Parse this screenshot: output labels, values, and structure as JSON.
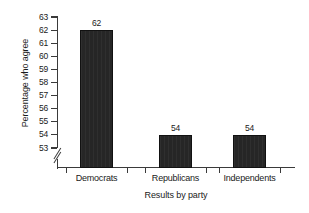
{
  "chart_data": {
    "type": "bar",
    "title": "",
    "xlabel": "Results by party",
    "ylabel": "Percentage who agree",
    "categories": [
      "Democrats",
      "Republicans",
      "Independents"
    ],
    "values": [
      62,
      54,
      54
    ],
    "data_labels": [
      "62",
      "54",
      "54"
    ],
    "ylim": [
      53,
      63
    ],
    "ytick_step": 1,
    "yticks": [
      63,
      62,
      61,
      60,
      59,
      58,
      57,
      56,
      55,
      54,
      53
    ],
    "ytick_labels": [
      "63",
      "62",
      "61",
      "60",
      "59",
      "58",
      "57",
      "56",
      "55",
      "54",
      "53"
    ],
    "axis_break": {
      "present": true,
      "axis": "y",
      "below_value": 53,
      "symbol": "double-slash"
    },
    "grid": false,
    "legend": null,
    "bar_color": "#262626",
    "axis_color": "#3a3a3a",
    "text_color": "#1a1a1a",
    "background_color": "#ffffff"
  }
}
